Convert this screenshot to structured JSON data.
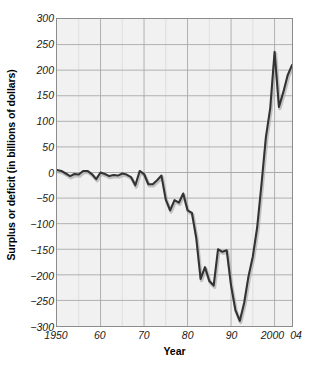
{
  "chart_data": {
    "type": "line",
    "title": "",
    "xlabel": "Year",
    "ylabel": "Surplus or deficit (in billions of dollars)",
    "xlim": [
      1950,
      2004
    ],
    "ylim": [
      -300,
      300
    ],
    "xticks": [
      1950,
      1960,
      1970,
      1980,
      1990,
      2000,
      2004
    ],
    "xticklabels": [
      "1950",
      "60",
      "70",
      "80",
      "90",
      "2000",
      "04"
    ],
    "yticks": [
      300,
      250,
      200,
      150,
      100,
      50,
      0,
      -50,
      -100,
      -150,
      -200,
      -250,
      -300
    ],
    "yticklabels": [
      "300",
      "250",
      "200",
      "150",
      "100",
      "50",
      "0",
      "-50",
      "-100",
      "-150",
      "-200",
      "-250",
      "-300"
    ],
    "grid": true,
    "grid_x_step": 5,
    "grid_y_step": 50,
    "legend": "none",
    "line_color": "#333333",
    "background_color": "#f1f1f1",
    "grid_color": "#a8a8a8",
    "axis_color": "#8c8c8c",
    "series": [
      {
        "name": "Federal surplus or deficit",
        "x": [
          1950,
          1951,
          1952,
          1953,
          1954,
          1955,
          1956,
          1957,
          1958,
          1959,
          1960,
          1961,
          1962,
          1963,
          1964,
          1965,
          1966,
          1967,
          1968,
          1969,
          1970,
          1971,
          1972,
          1973,
          1974,
          1975,
          1976,
          1977,
          1978,
          1979,
          1980,
          1981,
          1982,
          1983,
          1984,
          1985,
          1986,
          1987,
          1988,
          1989,
          1990,
          1991,
          1992,
          1993,
          1994,
          1995,
          1996,
          1997,
          1998,
          1999,
          2000,
          2001,
          2002,
          2003,
          2004
        ],
        "values": [
          5,
          3,
          -2,
          -7,
          -3,
          -4,
          3,
          3,
          -3,
          -13,
          0,
          -3,
          -7,
          -5,
          -6,
          -2,
          -4,
          -9,
          -25,
          3,
          -3,
          -23,
          -23,
          -15,
          -6,
          -53,
          -74,
          -54,
          -59,
          -41,
          -74,
          -79,
          -128,
          -208,
          -185,
          -212,
          -221,
          -150,
          -155,
          -152,
          -221,
          -269,
          -290,
          -255,
          -203,
          -164,
          -107,
          -22,
          69,
          126,
          236,
          128,
          157,
          190,
          210
        ]
      }
    ]
  },
  "axis": {
    "y_title": "Surplus or deficit (in billions of dollars)",
    "x_title": "Year"
  }
}
